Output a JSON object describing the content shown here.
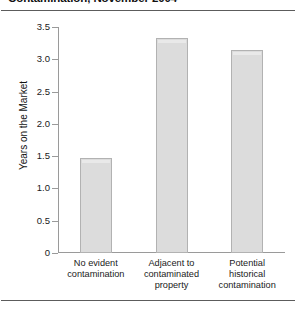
{
  "figure": {
    "caption": "Contamination, November 2004",
    "caption_note": "bold caption clipped at top edge of image"
  },
  "chart_data": {
    "type": "bar",
    "title": "Contamination, November 2004",
    "categories": [
      "No evident contamination",
      "Adjacent to contaminated property",
      "Potential historical contamination"
    ],
    "category_lines": [
      [
        "No evident",
        "contamination"
      ],
      [
        "Adjacent to",
        "contaminated",
        "property"
      ],
      [
        "Potential",
        "historical",
        "contamination"
      ]
    ],
    "values": [
      1.47,
      3.33,
      3.15
    ],
    "xlabel": "",
    "ylabel": "Years on the Market",
    "ylim": [
      0,
      3.5
    ],
    "yticks": [
      0,
      0.5,
      1.0,
      1.5,
      2.0,
      2.5,
      3.0,
      3.5
    ],
    "ytick_labels": [
      "0",
      "0.5",
      "1.0",
      "1.5",
      "2.0",
      "2.5",
      "3.0",
      "3.5"
    ],
    "grid": false,
    "legend": null,
    "colors": {
      "bar_fill": "#dcdcdc",
      "bar_border": "#b2b2b2",
      "axis": "#9a9a9a",
      "rule": "#5c5c5c",
      "text": "#1a1a1a"
    }
  }
}
